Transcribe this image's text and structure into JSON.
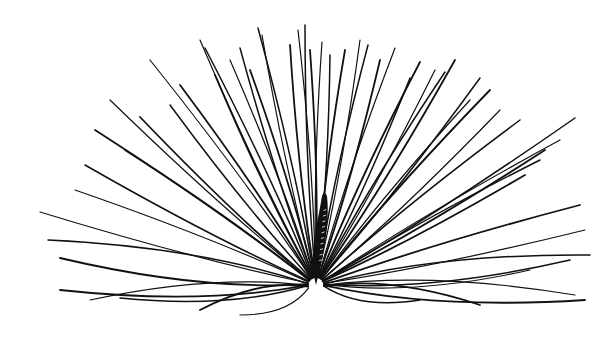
{
  "illustration": {
    "subject": "seed with radiating pappus bristles",
    "ink_color": "#111111",
    "background_color": "#ffffff",
    "base_point": [
      316,
      285
    ],
    "seed": {
      "top": [
        324,
        192
      ],
      "bottom": [
        316,
        285
      ],
      "width": 12
    },
    "bristle_tips": [
      [
        40,
        212
      ],
      [
        48,
        240
      ],
      [
        60,
        258
      ],
      [
        75,
        190
      ],
      [
        85,
        165
      ],
      [
        95,
        130
      ],
      [
        110,
        100
      ],
      [
        125,
        150
      ],
      [
        140,
        117
      ],
      [
        150,
        60
      ],
      [
        170,
        105
      ],
      [
        180,
        85
      ],
      [
        200,
        40
      ],
      [
        205,
        48
      ],
      [
        215,
        75
      ],
      [
        230,
        60
      ],
      [
        240,
        48
      ],
      [
        250,
        70
      ],
      [
        262,
        35
      ],
      [
        258,
        28
      ],
      [
        290,
        45
      ],
      [
        298,
        30
      ],
      [
        305,
        25
      ],
      [
        310,
        50
      ],
      [
        322,
        42
      ],
      [
        330,
        55
      ],
      [
        345,
        50
      ],
      [
        360,
        40
      ],
      [
        368,
        45
      ],
      [
        380,
        60
      ],
      [
        395,
        48
      ],
      [
        410,
        78
      ],
      [
        420,
        62
      ],
      [
        435,
        70
      ],
      [
        445,
        72
      ],
      [
        455,
        60
      ],
      [
        470,
        100
      ],
      [
        480,
        78
      ],
      [
        490,
        90
      ],
      [
        500,
        110
      ],
      [
        520,
        120
      ],
      [
        545,
        150
      ],
      [
        560,
        140
      ],
      [
        575,
        118
      ],
      [
        580,
        205
      ],
      [
        585,
        230
      ],
      [
        590,
        255
      ],
      [
        585,
        300
      ],
      [
        575,
        295
      ],
      [
        570,
        260
      ],
      [
        60,
        290
      ],
      [
        90,
        300
      ],
      [
        120,
        298
      ],
      [
        200,
        310
      ],
      [
        240,
        315
      ],
      [
        420,
        300
      ],
      [
        480,
        305
      ],
      [
        530,
        270
      ],
      [
        540,
        160
      ],
      [
        525,
        175
      ]
    ]
  }
}
